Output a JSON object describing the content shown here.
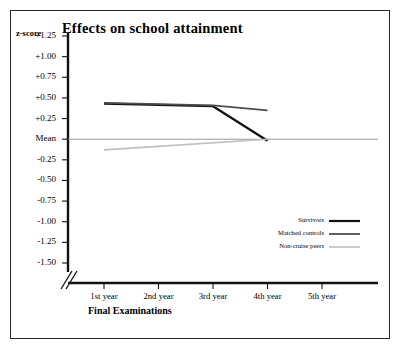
{
  "chart_data": {
    "type": "line",
    "title": "Effects on school attainment",
    "xlabel": "Final Examinations",
    "ylabel": "z-score",
    "categories": [
      "1st year",
      "2nd year",
      "3rd year",
      "4th year",
      "5th year"
    ],
    "x": [
      1,
      2,
      3,
      4,
      5
    ],
    "ylim": [
      -1.5,
      1.25
    ],
    "yticks": [
      "+1.25",
      "+1.00",
      "+0.75",
      "+0.50",
      "+0.25",
      "Mean",
      "-0.25",
      "-0.50",
      "-0.75",
      "-1.00",
      "-1.25",
      "-1.50"
    ],
    "ytick_values": [
      1.25,
      1.0,
      0.75,
      0.5,
      0.25,
      0.0,
      -0.25,
      -0.5,
      -0.75,
      -1.0,
      -1.25,
      -1.5
    ],
    "grid": false,
    "reference_line": {
      "label": "Mean",
      "value": 0.0
    },
    "axis_break": true,
    "legend_position": "inside-lower-right",
    "series": [
      {
        "name": "Survivors",
        "color": "#111111",
        "width": 2.2,
        "x": [
          1,
          3,
          4
        ],
        "values": [
          0.43,
          0.4,
          -0.02
        ]
      },
      {
        "name": "Matched controls",
        "color": "#4d4d4d",
        "width": 1.8,
        "x": [
          1,
          3,
          4
        ],
        "values": [
          0.44,
          0.41,
          0.35
        ]
      },
      {
        "name": "Non-cruise peers",
        "color": "#bfbfbf",
        "width": 1.6,
        "x": [
          1,
          4
        ],
        "values": [
          -0.13,
          0.0
        ]
      }
    ]
  },
  "legend": {
    "items": [
      {
        "label": "Survivors"
      },
      {
        "label": "Matched controls"
      },
      {
        "label": "Non-cruise peers"
      }
    ]
  }
}
